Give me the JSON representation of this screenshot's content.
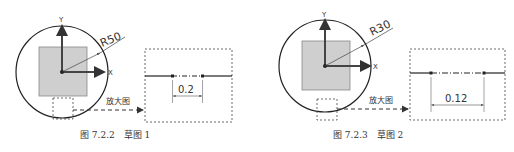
{
  "figures": [
    {
      "caption": "图 7.2.2　草图 1",
      "radius_label": "R50",
      "axis_x_label": "X",
      "axis_y_label": "Y",
      "magnify_label": "放大图",
      "dimension_value": "0.2"
    },
    {
      "caption": "图 7.2.3　草图 2",
      "radius_label": "R30",
      "axis_x_label": "X",
      "axis_y_label": "Y",
      "magnify_label": "放大图",
      "dimension_value": "0.12"
    }
  ],
  "colors": {
    "line": "#222222",
    "square_fill": "#cfcfcf",
    "square_stroke": "#888888",
    "dim": "#555555"
  }
}
